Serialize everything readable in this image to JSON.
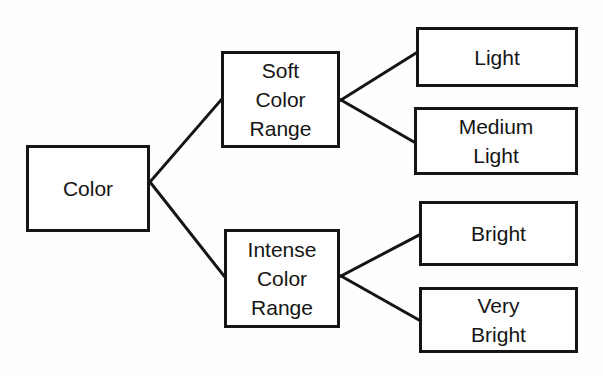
{
  "diagram": {
    "type": "tree",
    "background_color": "#fefefe",
    "stroke_color": "#151515",
    "fill_color": "#ffffff",
    "stroke_width": 3,
    "nodes": {
      "root": {
        "id": "color",
        "label": "Color",
        "x": 26,
        "y": 145,
        "w": 124,
        "h": 87
      },
      "branch_soft": {
        "id": "soft-color-range",
        "label": "Soft\nColor\nRange",
        "x": 221,
        "y": 51,
        "w": 119,
        "h": 97
      },
      "branch_intense": {
        "id": "intense-color-range",
        "label": "Intense\nColor\nRange",
        "x": 224,
        "y": 229,
        "w": 116,
        "h": 99
      },
      "leaf_light": {
        "id": "light",
        "label": "Light",
        "x": 416,
        "y": 27,
        "w": 162,
        "h": 60
      },
      "leaf_medium_light": {
        "id": "medium-light",
        "label": "Medium\nLight",
        "x": 414,
        "y": 107,
        "w": 164,
        "h": 68
      },
      "leaf_bright": {
        "id": "bright",
        "label": "Bright",
        "x": 419,
        "y": 201,
        "w": 159,
        "h": 65
      },
      "leaf_very_bright": {
        "id": "very-bright",
        "label": "Very\nBright",
        "x": 419,
        "y": 287,
        "w": 159,
        "h": 66
      }
    },
    "edges": [
      {
        "from": "color",
        "to": "soft-color-range",
        "points": "150,182 150,182 221,100"
      },
      {
        "from": "color",
        "to": "intense-color-range",
        "points": "150,182 150,182 224,276"
      },
      {
        "from": "soft-color-range",
        "to": "light",
        "points": "341,100 416,53"
      },
      {
        "from": "soft-color-range",
        "to": "medium-light",
        "points": "341,100 414,142"
      },
      {
        "from": "intense-color-range",
        "to": "bright",
        "points": "341,276 419,235"
      },
      {
        "from": "intense-color-range",
        "to": "very-bright",
        "points": "341,276 419,320"
      }
    ]
  }
}
